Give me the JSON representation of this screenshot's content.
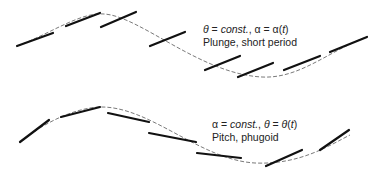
{
  "diagram": {
    "colors": {
      "segment": "#111111",
      "path": "#7a7a7a",
      "text": "#222222",
      "background": "#ffffff"
    },
    "top": {
      "caption_line1": {
        "theta": "θ",
        "eq1": " = ",
        "const": "const.",
        "sep": ", α = α(",
        "t": "t",
        "close": ")"
      },
      "caption_line2": "Plunge, short period",
      "path": "M17,46 C50,34 80,12 104,14 C140,16 200,74 262,77 C300,79 330,50 367,37",
      "segments": [
        [
          17,
          46,
          53,
          33
        ],
        [
          66,
          26,
          100,
          13
        ],
        [
          101,
          27,
          136,
          12
        ],
        [
          150,
          46,
          185,
          32
        ],
        [
          205,
          70,
          240,
          56
        ],
        [
          238,
          77,
          273,
          63
        ],
        [
          284,
          70,
          320,
          56
        ],
        [
          330,
          52,
          367,
          37
        ]
      ]
    },
    "bottom": {
      "caption_line1": {
        "alpha": "α",
        "eq1": " = ",
        "const": "const.",
        "sep": ", ",
        "theta": "θ",
        "eq2": " = ",
        "theta2": "θ",
        "paren": "(",
        "t": "t",
        "close": ")"
      },
      "caption_line2": "Pitch, phugoid",
      "path": "M20,142 C45,122 75,108 100,107 C150,106 200,160 255,163 C300,165 330,145 350,135",
      "segments": [
        [
          20,
          142,
          49,
          120
        ],
        [
          61,
          117,
          100,
          107
        ],
        [
          108,
          113,
          149,
          122
        ],
        [
          149,
          133,
          196,
          142
        ],
        [
          197,
          153,
          241,
          158
        ],
        [
          266,
          166,
          302,
          150
        ],
        [
          320,
          150,
          349,
          130
        ]
      ]
    }
  }
}
